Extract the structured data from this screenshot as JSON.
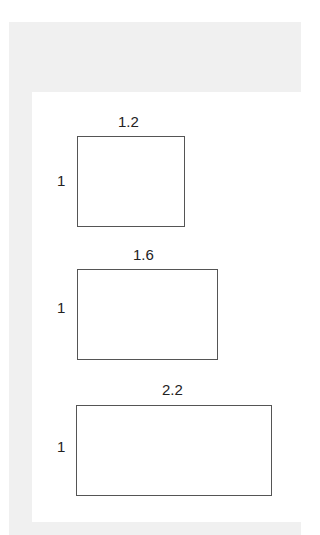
{
  "diagram": {
    "shapes": [
      {
        "width_label": "1.2",
        "height_label": "1",
        "x": 77,
        "y": 136,
        "w": 108,
        "h": 91
      },
      {
        "width_label": "1.6",
        "height_label": "1",
        "x": 77,
        "y": 269,
        "w": 141,
        "h": 91
      },
      {
        "width_label": "2.2",
        "height_label": "1",
        "x": 76,
        "y": 405,
        "w": 196,
        "h": 91
      }
    ],
    "colors": {
      "background": "#f0f0f0",
      "panel": "#ffffff",
      "stroke": "#555555",
      "text": "#222222"
    }
  }
}
